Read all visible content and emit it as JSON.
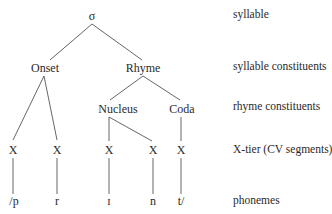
{
  "diagram": {
    "type": "syllable-tree",
    "nodes": {
      "syllable": "σ",
      "onset": "Onset",
      "rhyme": "Rhyme",
      "nucleus": "Nucleus",
      "coda": "Coda",
      "x_slots": [
        "X",
        "X",
        "X",
        "X",
        "X"
      ],
      "phonemes": [
        "/p",
        "r",
        "ɪ",
        "n",
        "t/"
      ]
    },
    "tier_labels": {
      "syllable": "syllable",
      "syllable_constituents": "syllable constituents",
      "rhyme_constituents": "rhyme constituents",
      "x_tier": "X-tier (CV segments)",
      "phonemes": "phonemes"
    },
    "edges": [
      [
        "σ",
        "Onset"
      ],
      [
        "σ",
        "Rhyme"
      ],
      [
        "Onset",
        "X1"
      ],
      [
        "Onset",
        "X2"
      ],
      [
        "Rhyme",
        "Nucleus"
      ],
      [
        "Rhyme",
        "Coda"
      ],
      [
        "Nucleus",
        "X3"
      ],
      [
        "Nucleus",
        "X4"
      ],
      [
        "Coda",
        "X5"
      ],
      [
        "X1",
        "/p"
      ],
      [
        "X2",
        "r"
      ],
      [
        "X3",
        "ɪ"
      ],
      [
        "X4",
        "n"
      ],
      [
        "X5",
        "t/"
      ]
    ],
    "line_color": "#555555"
  }
}
